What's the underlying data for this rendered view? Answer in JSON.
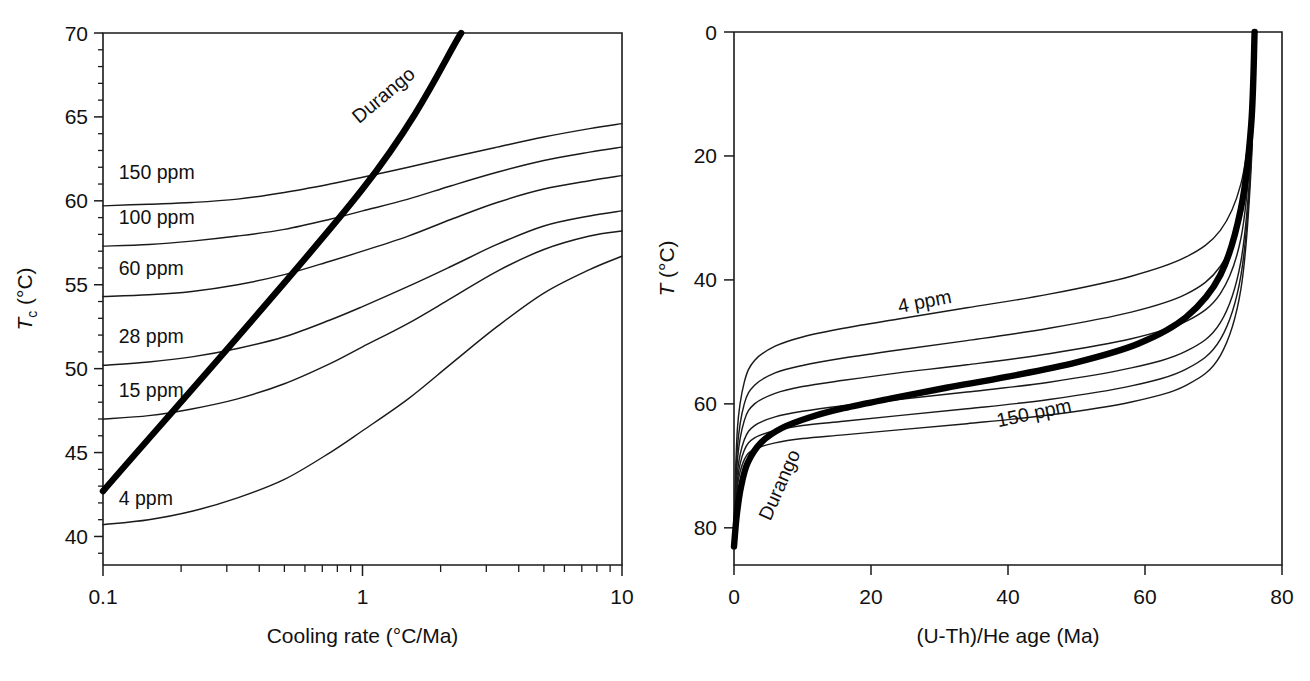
{
  "figure": {
    "background": "#ffffff",
    "line_color": "#1a1a1a",
    "bold_line_color": "#000000"
  },
  "chart_data": [
    {
      "type": "line",
      "panel": "left",
      "title": "",
      "xlabel": "Cooling rate (°C/Ma)",
      "ylabel": "Tᴄ (°C)",
      "ylabel_main": "T",
      "ylabel_sub": "c",
      "ylabel_unit": " (°C)",
      "xscale": "log",
      "yscale": "linear",
      "xlim": [
        0.1,
        10
      ],
      "ylim": [
        38.3,
        70
      ],
      "xticks": [
        0.1,
        1,
        10
      ],
      "xticklabels": [
        "0.1",
        "1",
        "10"
      ],
      "yticks": [
        40,
        45,
        50,
        55,
        60,
        65,
        70
      ],
      "yticklabels": [
        "40",
        "45",
        "50",
        "55",
        "60",
        "65",
        "70"
      ],
      "grid": false,
      "legend": "inline-curve-labels",
      "x": [
        0.1,
        0.15,
        0.22,
        0.33,
        0.5,
        0.75,
        1.0,
        1.5,
        2.2,
        3.3,
        5.0,
        7.5,
        10.0
      ],
      "series": [
        {
          "name": "150 ppm",
          "label": "150 ppm",
          "label_x": 0.115,
          "label_y": 61.3,
          "values": [
            59.7,
            59.8,
            59.9,
            60.1,
            60.5,
            61.0,
            61.4,
            62.0,
            62.6,
            63.2,
            63.8,
            64.3,
            64.6
          ]
        },
        {
          "name": "100 ppm",
          "label": "100 ppm",
          "label_x": 0.115,
          "label_y": 58.6,
          "values": [
            57.3,
            57.4,
            57.6,
            57.9,
            58.3,
            58.9,
            59.4,
            60.1,
            60.9,
            61.7,
            62.4,
            62.9,
            63.2
          ]
        },
        {
          "name": "60 ppm",
          "label": "60 ppm",
          "label_x": 0.115,
          "label_y": 55.6,
          "values": [
            54.3,
            54.4,
            54.6,
            55.0,
            55.6,
            56.4,
            57.0,
            57.9,
            58.9,
            59.9,
            60.7,
            61.2,
            61.5
          ]
        },
        {
          "name": "28 ppm",
          "label": "28 ppm",
          "label_x": 0.115,
          "label_y": 51.5,
          "values": [
            50.2,
            50.4,
            50.7,
            51.2,
            51.9,
            52.9,
            53.7,
            54.9,
            56.1,
            57.4,
            58.5,
            59.1,
            59.4
          ]
        },
        {
          "name": "15 ppm",
          "label": "15 ppm",
          "label_x": 0.115,
          "label_y": 48.3,
          "values": [
            47.0,
            47.2,
            47.6,
            48.2,
            49.1,
            50.3,
            51.3,
            52.7,
            54.2,
            55.8,
            57.1,
            57.9,
            58.2
          ]
        },
        {
          "name": "4 ppm",
          "label": "4 ppm",
          "label_x": 0.115,
          "label_y": 41.9,
          "values": [
            40.7,
            41.0,
            41.5,
            42.3,
            43.4,
            45.0,
            46.3,
            48.2,
            50.3,
            52.5,
            54.5,
            55.9,
            56.7
          ]
        }
      ],
      "bold_series": {
        "name": "Durango",
        "label": "Durango",
        "x": [
          0.1,
          1.0,
          2.4
        ],
        "values": [
          42.7,
          60.7,
          70.0
        ],
        "label_angle": -40,
        "label_x": 1.25,
        "label_y": 66.0
      }
    },
    {
      "type": "line",
      "panel": "right",
      "title": "",
      "xlabel": "(U-Th)/He age (Ma)",
      "ylabel": "T (°C)",
      "xscale": "linear",
      "yscale": "linear",
      "xlim": [
        0,
        80
      ],
      "ylim": [
        0,
        86
      ],
      "y_inverted": true,
      "xticks": [
        0,
        20,
        40,
        60,
        80
      ],
      "xticklabels": [
        "0",
        "20",
        "40",
        "60",
        "80"
      ],
      "yticks": [
        0,
        20,
        40,
        60,
        80
      ],
      "yticklabels": [
        "0",
        "20",
        "40",
        "60",
        "80"
      ],
      "grid": false,
      "legend": "inline-curve-labels",
      "convergence_age": 76,
      "series": [
        {
          "name": "4 ppm",
          "label": "4 ppm",
          "label_x": 28,
          "label_y": 44.5,
          "label_angle": -11,
          "x": [
            0.0,
            0.5,
            1.5,
            3,
            6,
            10,
            16,
            24,
            34,
            46,
            58,
            66,
            71,
            74,
            75.5,
            76.0
          ],
          "values": [
            80.0,
            64.0,
            56.5,
            53.0,
            50.7,
            49.2,
            47.8,
            46.3,
            44.5,
            42.3,
            39.4,
            36.3,
            32.0,
            24.5,
            13.0,
            0.0
          ]
        },
        {
          "name": "15 ppm",
          "label": "",
          "label_x": 0,
          "label_y": 0,
          "label_angle": 0,
          "x": [
            0.0,
            0.5,
            1.5,
            3,
            6,
            10,
            16,
            24,
            34,
            46,
            58,
            66,
            71,
            74,
            75.5,
            76.0
          ],
          "values": [
            80.5,
            67.0,
            60.0,
            57.0,
            55.0,
            53.8,
            52.6,
            51.3,
            49.8,
            47.8,
            45.2,
            42.3,
            37.8,
            29.5,
            15.5,
            0.0
          ]
        },
        {
          "name": "28 ppm",
          "label": "",
          "label_x": 0,
          "label_y": 0,
          "label_angle": 0,
          "x": [
            0.0,
            0.5,
            1.5,
            3,
            6,
            10,
            16,
            24,
            34,
            46,
            58,
            66,
            71,
            74,
            75.5,
            76.0
          ],
          "values": [
            81.0,
            69.0,
            62.7,
            60.0,
            58.3,
            57.2,
            56.2,
            55.0,
            53.7,
            51.9,
            49.5,
            46.7,
            42.2,
            33.3,
            17.5,
            0.0
          ]
        },
        {
          "name": "60 ppm",
          "label": "",
          "label_x": 0,
          "label_y": 0,
          "label_angle": 0,
          "x": [
            0.0,
            0.5,
            1.5,
            3,
            6,
            10,
            16,
            24,
            34,
            46,
            58,
            66,
            71,
            74,
            75.5,
            76.0
          ],
          "values": [
            81.5,
            71.0,
            65.8,
            63.5,
            62.1,
            61.2,
            60.3,
            59.3,
            58.1,
            56.5,
            54.2,
            51.5,
            46.9,
            37.0,
            19.5,
            0.0
          ]
        },
        {
          "name": "100 ppm",
          "label": "",
          "label_x": 0,
          "label_y": 0,
          "label_angle": 0,
          "x": [
            0.0,
            0.5,
            1.5,
            3,
            6,
            10,
            16,
            24,
            34,
            46,
            58,
            66,
            71,
            74,
            75.5,
            76.0
          ],
          "values": [
            81.8,
            72.3,
            67.5,
            65.5,
            64.3,
            63.5,
            62.8,
            61.9,
            60.8,
            59.3,
            57.1,
            54.4,
            49.6,
            39.3,
            20.7,
            0.0
          ]
        },
        {
          "name": "150 ppm",
          "label": "150 ppm",
          "label_x": 44,
          "label_y": 62.5,
          "label_angle": -12,
          "x": [
            0.0,
            0.5,
            1.5,
            3,
            6,
            10,
            16,
            24,
            34,
            46,
            58,
            66,
            71,
            74,
            75.5,
            76.0
          ],
          "values": [
            82.0,
            73.3,
            69.0,
            67.3,
            66.3,
            65.6,
            65.0,
            64.2,
            63.2,
            61.8,
            59.7,
            57.0,
            52.2,
            41.5,
            21.8,
            0.0
          ]
        }
      ],
      "bold_series": {
        "name": "Durango",
        "label": "Durango",
        "label_x": 7.5,
        "label_y": 73.5,
        "label_angle": -66,
        "x": [
          0.0,
          0.4,
          1.0,
          2.0,
          4.0,
          7.0,
          11,
          16,
          23,
          31,
          40,
          50,
          59,
          66,
          71,
          74,
          75.5,
          76.0
        ],
        "values": [
          83.0,
          78.0,
          73.5,
          69.5,
          66.2,
          63.9,
          62.2,
          60.7,
          59.1,
          57.4,
          55.6,
          53.3,
          50.3,
          46.0,
          39.2,
          28.5,
          15.0,
          0.0
        ]
      }
    }
  ]
}
